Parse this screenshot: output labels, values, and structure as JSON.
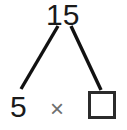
{
  "diagram": {
    "type": "factor-tree",
    "product": {
      "label": "15",
      "value": 15,
      "role": "product"
    },
    "factors": [
      {
        "label": "5",
        "value": 5,
        "role": "known-factor",
        "filled": true
      },
      {
        "label": "",
        "value": null,
        "role": "missing-factor",
        "filled": false,
        "placeholder": ""
      }
    ],
    "operator": {
      "label": "×",
      "name": "multiplication-sign"
    },
    "branches": [
      {
        "name": "left-branch",
        "from": "product",
        "to": "known-factor"
      },
      {
        "name": "right-branch",
        "from": "product",
        "to": "missing-factor"
      }
    ],
    "colors": {
      "ink": "#1a1a1a",
      "branch": "#111111",
      "operator": "#6e6e6e",
      "box_border": "#2b2b2b",
      "background": "#ffffff"
    }
  }
}
